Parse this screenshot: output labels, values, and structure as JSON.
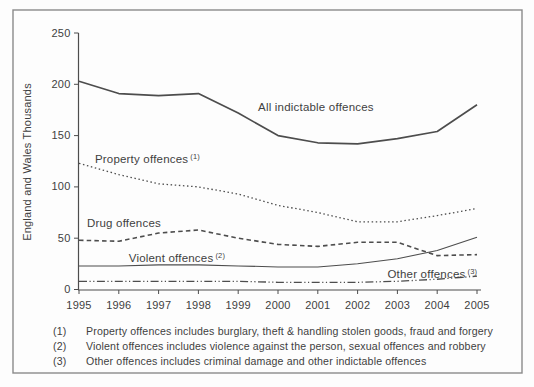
{
  "figure": {
    "background": "#fdfdfd",
    "frame_border_color": "#8a8a8a",
    "text_color": "#3f3f3f",
    "line_color": "#4d4d4d"
  },
  "chart_data": {
    "type": "line",
    "title": "",
    "xlabel": "",
    "ylabel": "England and Wales Thousands",
    "x": [
      1995,
      1996,
      1997,
      1998,
      1999,
      2000,
      2001,
      2002,
      2003,
      2004,
      2005
    ],
    "xlim": [
      1995,
      2005
    ],
    "ylim": [
      0,
      250
    ],
    "y_ticks": [
      0,
      50,
      100,
      150,
      200,
      250
    ],
    "grid": false,
    "legend": "inline-series-labels",
    "series": [
      {
        "name": "All indictable offences",
        "label": "All indictable offences",
        "sup": "",
        "style": "solid",
        "values": [
          203,
          191,
          189,
          191,
          172,
          150,
          143,
          142,
          147,
          154,
          180
        ],
        "label_anchor": {
          "x": 1999.5,
          "y": 178
        }
      },
      {
        "name": "Property offences",
        "label": "Property offences",
        "sup": "(1)",
        "style": "dotted",
        "values": [
          123,
          112,
          103,
          100,
          93,
          82,
          75,
          66,
          66,
          72,
          79
        ],
        "label_anchor": {
          "x": 1995.4,
          "y": 127
        }
      },
      {
        "name": "Drug offences",
        "label": "Drug offences",
        "sup": "",
        "style": "dashed",
        "values": [
          48,
          47,
          55,
          58,
          50,
          44,
          42,
          46,
          46,
          33,
          34
        ],
        "label_anchor": {
          "x": 1995.2,
          "y": 65
        }
      },
      {
        "name": "Violent offences",
        "label": "Violent offences",
        "sup": "(2)",
        "style": "thin-solid",
        "values": [
          23,
          23,
          24,
          24,
          23,
          22,
          22,
          25,
          30,
          38,
          51
        ],
        "label_anchor": {
          "x": 1996.25,
          "y": 31
        }
      },
      {
        "name": "Other offences",
        "label": "Other offences",
        "sup": "(3)",
        "style": "dash-dot-dot",
        "values": [
          8,
          8,
          8,
          8,
          8,
          7,
          7,
          7,
          8,
          10,
          13
        ],
        "label_anchor": {
          "x": 2002.75,
          "y": 15.5
        }
      }
    ],
    "footnotes": [
      {
        "num": "(1)",
        "text": "Property offences includes burglary, theft & handling stolen goods, fraud and forgery"
      },
      {
        "num": "(2)",
        "text": "Violent offences includes violence against the person, sexual offences and robbery"
      },
      {
        "num": "(3)",
        "text": "Other offences includes criminal damage and other indictable offences"
      }
    ]
  }
}
